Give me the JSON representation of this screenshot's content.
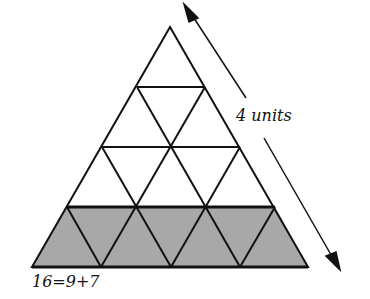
{
  "diagram": {
    "side_label": "4 units",
    "equation_label": "16=9+7",
    "rows": 4,
    "total_small_triangles": 16,
    "unshaded_count": 9,
    "shaded_count": 7,
    "colors": {
      "line": "#111111",
      "shade": "#a8a8a8",
      "background": "#ffffff"
    }
  }
}
